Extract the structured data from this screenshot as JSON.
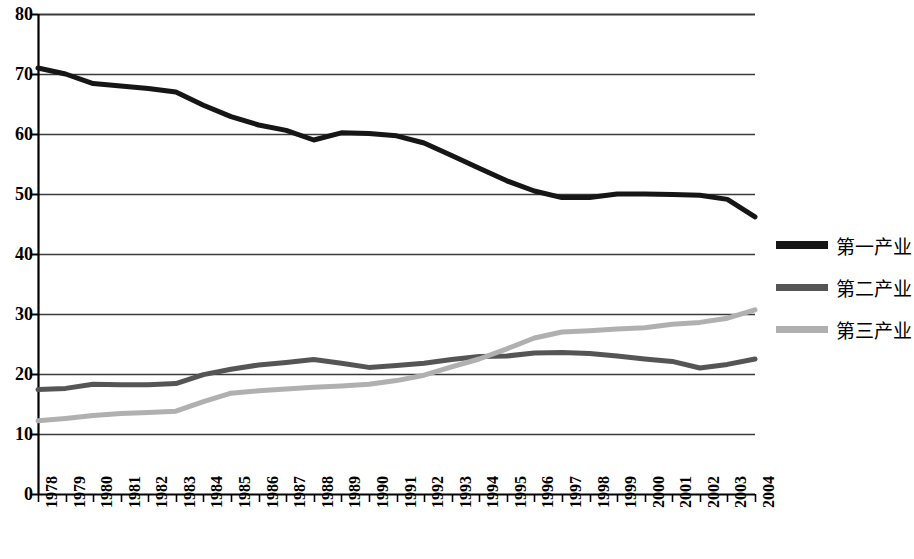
{
  "chart_data": {
    "type": "line",
    "title": "",
    "subtitle": "",
    "xlabel": "",
    "ylabel": "",
    "ylim": [
      0,
      80
    ],
    "y_ticks": [
      0,
      10,
      20,
      30,
      40,
      50,
      60,
      70,
      80
    ],
    "grid": true,
    "legend_position": "right",
    "x_label_rotation": -90,
    "categories": [
      "1978",
      "1979",
      "1980",
      "1981",
      "1982",
      "1983",
      "1984",
      "1985",
      "1986",
      "1987",
      "1988",
      "1989",
      "1990",
      "1991",
      "1992",
      "1993",
      "1994",
      "1995",
      "1996",
      "1997",
      "1998",
      "1999",
      "2000",
      "2001",
      "2002",
      "2003",
      "2004"
    ],
    "series": [
      {
        "name": "第一产业",
        "color": "#161616",
        "width": 5,
        "values": [
          71.0,
          70.0,
          68.4,
          68.0,
          67.6,
          67.0,
          64.8,
          62.9,
          61.5,
          60.6,
          59.0,
          60.2,
          60.1,
          59.7,
          58.5,
          56.4,
          54.3,
          52.2,
          50.5,
          49.4,
          49.4,
          50.0,
          50.0,
          49.9,
          49.8,
          49.1,
          46.2
        ]
      },
      {
        "name": "第二产业",
        "color": "#555555",
        "width": 5,
        "values": [
          17.4,
          17.6,
          18.3,
          18.2,
          18.2,
          18.4,
          19.9,
          20.8,
          21.5,
          21.9,
          22.4,
          21.8,
          21.1,
          21.4,
          21.8,
          22.4,
          22.9,
          23.0,
          23.5,
          23.6,
          23.4,
          23.0,
          22.5,
          22.1,
          21.0,
          21.6,
          22.5
        ]
      },
      {
        "name": "第三产业",
        "color": "#b0b0b0",
        "width": 5,
        "values": [
          12.2,
          12.6,
          13.1,
          13.4,
          13.6,
          13.8,
          15.4,
          16.8,
          17.2,
          17.5,
          17.8,
          18.0,
          18.3,
          18.9,
          19.8,
          21.2,
          22.5,
          24.2,
          26.0,
          27.0,
          27.2,
          27.5,
          27.7,
          28.3,
          28.6,
          29.3,
          30.7
        ]
      }
    ]
  },
  "legend": {
    "items": [
      {
        "label": "第一产业",
        "swatch": "line-swatch-black"
      },
      {
        "label": "第二产业",
        "swatch": "line-swatch-darkgray"
      },
      {
        "label": "第三产业",
        "swatch": "line-swatch-lightgray"
      }
    ]
  },
  "colors": {
    "series_1": "#161616",
    "series_2": "#555555",
    "series_3": "#b0b0b0",
    "axis": "#000000",
    "gridline": "#3a3a3a",
    "background": "#ffffff"
  }
}
